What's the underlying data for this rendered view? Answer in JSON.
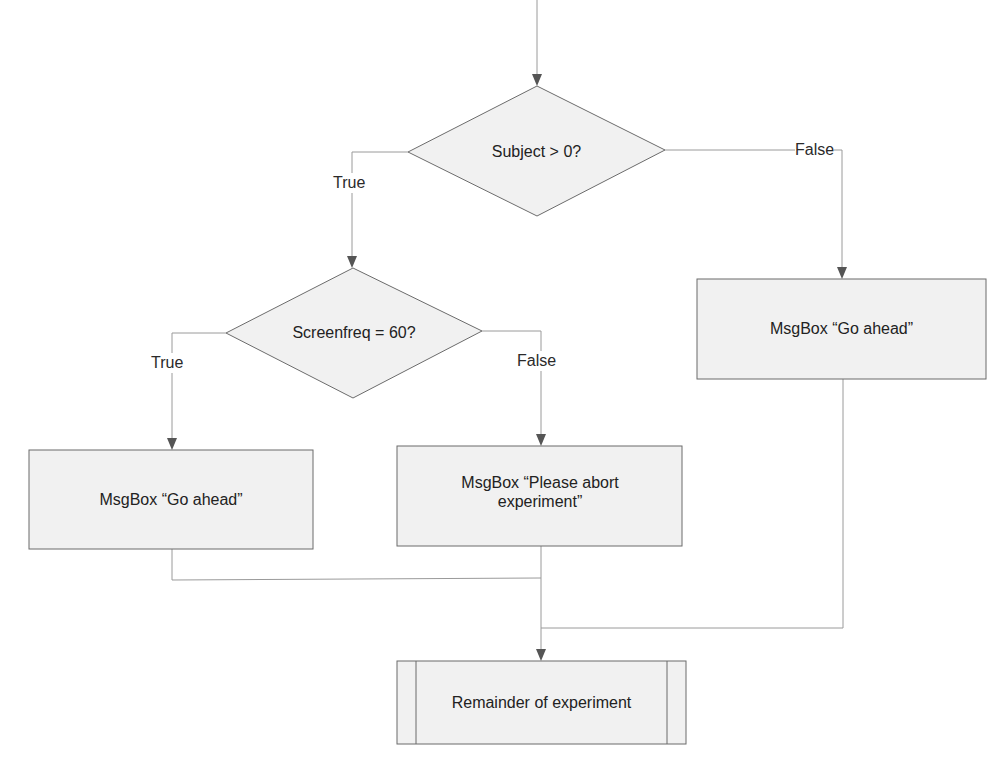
{
  "diagram": {
    "type": "flowchart",
    "colors": {
      "stroke": "#6b6b6b",
      "connector": "#9a9a9a",
      "fill": "#f1f1f1",
      "arrow": "#555555",
      "text": "#222222"
    },
    "nodes": {
      "decision_subject": {
        "shape": "diamond",
        "text": "Subject > 0?"
      },
      "decision_screenfreq": {
        "shape": "diamond",
        "text": "Screenfreq = 60?"
      },
      "msg_go_ahead_right": {
        "shape": "rectangle",
        "text": "MsgBox “Go ahead”"
      },
      "msg_go_ahead_left": {
        "shape": "rectangle",
        "text": "MsgBox “Go ahead”"
      },
      "msg_abort": {
        "shape": "rectangle",
        "text": "MsgBox “Please abort experiment”"
      },
      "remainder": {
        "shape": "predefined-process",
        "text": "Remainder of experiment"
      }
    },
    "edge_labels": {
      "subject_true": "True",
      "subject_false": "False",
      "screenfreq_true": "True",
      "screenfreq_false": "False"
    },
    "edges": [
      {
        "from": "start",
        "to": "decision_subject"
      },
      {
        "from": "decision_subject",
        "to": "decision_screenfreq",
        "label": "True"
      },
      {
        "from": "decision_subject",
        "to": "msg_go_ahead_right",
        "label": "False"
      },
      {
        "from": "decision_screenfreq",
        "to": "msg_go_ahead_left",
        "label": "True"
      },
      {
        "from": "decision_screenfreq",
        "to": "msg_abort",
        "label": "False"
      },
      {
        "from": "msg_go_ahead_left",
        "to": "remainder"
      },
      {
        "from": "msg_abort",
        "to": "remainder"
      },
      {
        "from": "msg_go_ahead_right",
        "to": "remainder"
      }
    ]
  }
}
